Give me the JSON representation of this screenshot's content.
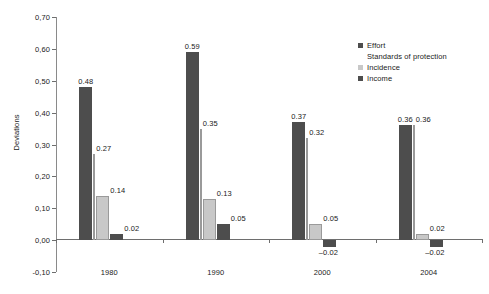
{
  "chart_data": {
    "type": "bar",
    "title": "",
    "subtitle": "",
    "xlabel": "",
    "ylabel": "Deviations",
    "categories": [
      "1980",
      "1990",
      "2000",
      "2004"
    ],
    "ylim": [
      -0.1,
      0.7
    ],
    "ytick_labels": [
      "0,70",
      "0,60",
      "0,50",
      "0,40",
      "0,30",
      "0,20",
      "0,10",
      "0,00",
      "-0,10"
    ],
    "ytick_values": [
      0.7,
      0.6,
      0.5,
      0.4,
      0.3,
      0.2,
      0.1,
      0.0,
      -0.1
    ],
    "grid": false,
    "legend_position": "upper-right",
    "series": [
      {
        "name": "Effort",
        "color": "#4d4d4d",
        "style": "filled",
        "values": [
          0.48,
          0.59,
          0.37,
          0.36
        ],
        "labels": [
          "0.48",
          "0.59",
          "0.37",
          "0.36"
        ]
      },
      {
        "name": "Standards of protection",
        "color": "#ffffff",
        "style": "hairline",
        "values": [
          0.27,
          0.35,
          0.32,
          0.36
        ],
        "labels": [
          "0.27",
          "0.35",
          "0.32",
          "0.36"
        ]
      },
      {
        "name": "Incidence",
        "color": "#c8c8c8",
        "style": "filled",
        "values": [
          0.14,
          0.13,
          0.05,
          0.02
        ],
        "labels": [
          "0.14",
          "0.13",
          "0.05",
          "0.02"
        ]
      },
      {
        "name": "Income",
        "color": "#4d4d4d",
        "style": "filled",
        "values": [
          0.02,
          0.05,
          -0.02,
          -0.02
        ],
        "labels": [
          "0.02",
          "0.05",
          "-0.02",
          "-0.02"
        ]
      }
    ]
  }
}
